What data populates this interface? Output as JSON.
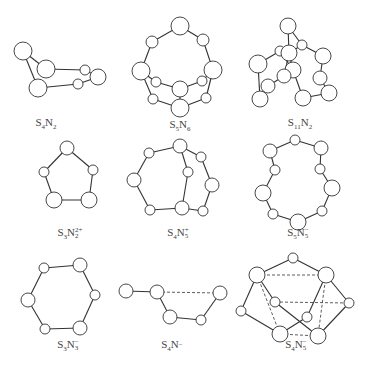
{
  "figure": {
    "molecules": [
      {
        "id": "s4n2",
        "label": {
          "base": [
            "S",
            "4",
            "N",
            "2"
          ],
          "charge": ""
        },
        "label_text": "S4N2",
        "label_pos": [
          46,
          124
        ],
        "atoms": [
          {
            "x": 23,
            "y": 51,
            "r": 9
          },
          {
            "x": 46,
            "y": 69,
            "r": 9
          },
          {
            "x": 38,
            "y": 88,
            "r": 9
          },
          {
            "x": 85,
            "y": 70,
            "r": 5
          },
          {
            "x": 98,
            "y": 77,
            "r": 8
          },
          {
            "x": 78,
            "y": 84,
            "r": 5
          }
        ],
        "bonds": [
          [
            0,
            1
          ],
          [
            0,
            2
          ],
          [
            1,
            3
          ],
          [
            3,
            4
          ],
          [
            4,
            5
          ],
          [
            5,
            2
          ]
        ],
        "dashed": []
      },
      {
        "id": "s5n6",
        "label": {
          "base": [
            "S",
            "5",
            "N",
            "6"
          ],
          "charge": ""
        },
        "label_text": "S5N6",
        "label_pos": [
          180,
          126
        ],
        "atoms": [
          {
            "x": 180,
            "y": 26,
            "r": 9
          },
          {
            "x": 152,
            "y": 42,
            "r": 6
          },
          {
            "x": 203,
            "y": 40,
            "r": 6
          },
          {
            "x": 141,
            "y": 71,
            "r": 9
          },
          {
            "x": 213,
            "y": 70,
            "r": 9
          },
          {
            "x": 156,
            "y": 82,
            "r": 5
          },
          {
            "x": 202,
            "y": 81,
            "r": 5
          },
          {
            "x": 180,
            "y": 89,
            "r": 8
          },
          {
            "x": 153,
            "y": 99,
            "r": 5
          },
          {
            "x": 206,
            "y": 98,
            "r": 5
          },
          {
            "x": 180,
            "y": 108,
            "r": 9
          }
        ],
        "bonds": [
          [
            0,
            1
          ],
          [
            0,
            2
          ],
          [
            1,
            3
          ],
          [
            2,
            4
          ],
          [
            3,
            5
          ],
          [
            5,
            7
          ],
          [
            7,
            6
          ],
          [
            6,
            4
          ],
          [
            3,
            8
          ],
          [
            8,
            10
          ],
          [
            4,
            9
          ],
          [
            9,
            10
          ],
          [
            7,
            10
          ]
        ],
        "dashed": []
      },
      {
        "id": "s11n2",
        "label": {
          "base": [
            "S",
            "11",
            "N",
            "2"
          ],
          "charge": ""
        },
        "label_text": "S11N2",
        "label_pos": [
          300,
          124
        ],
        "atoms": [
          {
            "x": 288,
            "y": 26,
            "r": 8
          },
          {
            "x": 302,
            "y": 45,
            "r": 5
          },
          {
            "x": 280,
            "y": 51,
            "r": 5
          },
          {
            "x": 289,
            "y": 53,
            "r": 8
          },
          {
            "x": 323,
            "y": 56,
            "r": 8
          },
          {
            "x": 258,
            "y": 64,
            "r": 9
          },
          {
            "x": 293,
            "y": 70,
            "r": 8
          },
          {
            "x": 284,
            "y": 76,
            "r": 7
          },
          {
            "x": 320,
            "y": 78,
            "r": 7
          },
          {
            "x": 268,
            "y": 86,
            "r": 7
          },
          {
            "x": 329,
            "y": 93,
            "r": 8
          },
          {
            "x": 260,
            "y": 99,
            "r": 8
          },
          {
            "x": 303,
            "y": 98,
            "r": 8
          }
        ],
        "bonds": [
          [
            0,
            1
          ],
          [
            0,
            3
          ],
          [
            1,
            4
          ],
          [
            1,
            3
          ],
          [
            2,
            3
          ],
          [
            2,
            5
          ],
          [
            2,
            6
          ],
          [
            3,
            6
          ],
          [
            6,
            12
          ],
          [
            5,
            11
          ],
          [
            11,
            9
          ],
          [
            9,
            7
          ],
          [
            7,
            3
          ],
          [
            4,
            8
          ],
          [
            8,
            10
          ],
          [
            10,
            12
          ]
        ],
        "dashed": []
      },
      {
        "id": "s3n2",
        "label": {
          "base": [
            "S",
            "3",
            "N",
            "2"
          ],
          "charge": "2+"
        },
        "label_text": "S3N2 2+",
        "label_pos": [
          70,
          234
        ],
        "atoms": [
          {
            "x": 67,
            "y": 148,
            "r": 7
          },
          {
            "x": 44,
            "y": 172,
            "r": 5
          },
          {
            "x": 93,
            "y": 170,
            "r": 5
          },
          {
            "x": 54,
            "y": 200,
            "r": 8
          },
          {
            "x": 89,
            "y": 200,
            "r": 8
          }
        ],
        "bonds": [
          [
            0,
            1
          ],
          [
            0,
            2
          ],
          [
            1,
            3
          ],
          [
            2,
            4
          ],
          [
            3,
            4
          ]
        ],
        "dashed": []
      },
      {
        "id": "s4n5_plus",
        "label": {
          "base": [
            "S",
            "4",
            "N",
            "5"
          ],
          "charge": "+"
        },
        "label_text": "S4N5 +",
        "label_pos": [
          178,
          234
        ],
        "atoms": [
          {
            "x": 180,
            "y": 146,
            "r": 7
          },
          {
            "x": 149,
            "y": 153,
            "r": 5
          },
          {
            "x": 201,
            "y": 157,
            "r": 5
          },
          {
            "x": 188,
            "y": 172,
            "r": 5
          },
          {
            "x": 134,
            "y": 180,
            "r": 7
          },
          {
            "x": 212,
            "y": 185,
            "r": 7
          },
          {
            "x": 150,
            "y": 210,
            "r": 5
          },
          {
            "x": 182,
            "y": 208,
            "r": 7
          },
          {
            "x": 203,
            "y": 211,
            "r": 5
          }
        ],
        "bonds": [
          [
            0,
            1
          ],
          [
            0,
            2
          ],
          [
            0,
            3
          ],
          [
            1,
            4
          ],
          [
            2,
            5
          ],
          [
            3,
            7
          ],
          [
            4,
            6
          ],
          [
            6,
            7
          ],
          [
            7,
            8
          ],
          [
            8,
            5
          ]
        ],
        "dashed": []
      },
      {
        "id": "s5n5_minus",
        "label": {
          "base": [
            "S",
            "5",
            "N",
            "5"
          ],
          "charge": "−"
        },
        "label_text": "S5N5 −",
        "label_pos": [
          298,
          234
        ],
        "atoms": [
          {
            "x": 295,
            "y": 140,
            "r": 5
          },
          {
            "x": 270,
            "y": 151,
            "r": 7
          },
          {
            "x": 321,
            "y": 148,
            "r": 7
          },
          {
            "x": 275,
            "y": 170,
            "r": 5
          },
          {
            "x": 320,
            "y": 169,
            "r": 5
          },
          {
            "x": 263,
            "y": 193,
            "r": 8
          },
          {
            "x": 332,
            "y": 188,
            "r": 8
          },
          {
            "x": 273,
            "y": 214,
            "r": 5
          },
          {
            "x": 322,
            "y": 211,
            "r": 5
          },
          {
            "x": 298,
            "y": 222,
            "r": 8
          }
        ],
        "bonds": [
          [
            0,
            1
          ],
          [
            0,
            2
          ],
          [
            1,
            3
          ],
          [
            2,
            4
          ],
          [
            3,
            5
          ],
          [
            4,
            6
          ],
          [
            5,
            7
          ],
          [
            6,
            8
          ],
          [
            7,
            9
          ],
          [
            8,
            9
          ]
        ],
        "dashed": []
      },
      {
        "id": "s3n3_minus",
        "label": {
          "base": [
            "S",
            "3",
            "N",
            "3"
          ],
          "charge": "−"
        },
        "label_text": "S3N3 −",
        "label_pos": [
          68,
          346
        ],
        "atoms": [
          {
            "x": 44,
            "y": 268,
            "r": 5
          },
          {
            "x": 80,
            "y": 265,
            "r": 7
          },
          {
            "x": 95,
            "y": 295,
            "r": 5
          },
          {
            "x": 28,
            "y": 300,
            "r": 7
          },
          {
            "x": 45,
            "y": 329,
            "r": 5
          },
          {
            "x": 80,
            "y": 328,
            "r": 7
          }
        ],
        "bonds": [
          [
            0,
            1
          ],
          [
            1,
            2
          ],
          [
            0,
            3
          ],
          [
            3,
            4
          ],
          [
            4,
            5
          ],
          [
            5,
            2
          ]
        ],
        "dashed": []
      },
      {
        "id": "s4n_minus",
        "label": {
          "base": [
            "S",
            "4",
            "N",
            ""
          ],
          "charge": "−"
        },
        "label_text": "S4N −",
        "label_pos": [
          172,
          346
        ],
        "atoms": [
          {
            "x": 126,
            "y": 291,
            "r": 7
          },
          {
            "x": 157,
            "y": 292,
            "r": 7
          },
          {
            "x": 220,
            "y": 293,
            "r": 7
          },
          {
            "x": 170,
            "y": 317,
            "r": 7
          },
          {
            "x": 201,
            "y": 320,
            "r": 5
          }
        ],
        "bonds": [
          [
            0,
            1
          ],
          [
            1,
            3
          ],
          [
            3,
            4
          ],
          [
            4,
            2
          ]
        ],
        "dashed": [
          [
            1,
            2
          ]
        ]
      },
      {
        "id": "s4n5_minus",
        "label": {
          "base": [
            "S",
            "4",
            "N",
            "5"
          ],
          "charge": "−"
        },
        "label_text": "S4N5 −",
        "label_pos": [
          296,
          346
        ],
        "atoms": [
          {
            "x": 293,
            "y": 258,
            "r": 5
          },
          {
            "x": 257,
            "y": 275,
            "r": 8
          },
          {
            "x": 326,
            "y": 275,
            "r": 8
          },
          {
            "x": 275,
            "y": 302,
            "r": 5
          },
          {
            "x": 349,
            "y": 303,
            "r": 5
          },
          {
            "x": 241,
            "y": 311,
            "r": 5
          },
          {
            "x": 307,
            "y": 317,
            "r": 5
          },
          {
            "x": 280,
            "y": 334,
            "r": 8
          },
          {
            "x": 318,
            "y": 336,
            "r": 8
          }
        ],
        "bonds": [
          [
            0,
            1
          ],
          [
            0,
            2
          ],
          [
            1,
            5
          ],
          [
            5,
            7
          ],
          [
            2,
            4
          ],
          [
            4,
            8
          ],
          [
            1,
            3
          ],
          [
            3,
            8
          ],
          [
            2,
            6
          ],
          [
            6,
            7
          ]
        ],
        "dashed": [
          [
            1,
            2
          ],
          [
            1,
            7
          ],
          [
            2,
            8
          ],
          [
            7,
            8
          ],
          [
            3,
            4
          ]
        ]
      }
    ]
  }
}
